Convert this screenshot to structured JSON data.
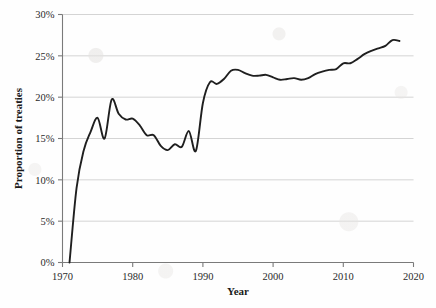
{
  "chart_data": {
    "type": "line",
    "title": "",
    "xlabel": "Year",
    "ylabel": "Proportion of treaties",
    "xlim": [
      1970,
      2020
    ],
    "ylim": [
      0,
      30
    ],
    "grid": true,
    "legend": false,
    "legend_position": "none",
    "x_ticks": [
      "1970",
      "1980",
      "1990",
      "2000",
      "2010",
      "2020"
    ],
    "x_tick_values": [
      1970,
      1980,
      1990,
      2000,
      2010,
      2020
    ],
    "y_ticks": [
      "0%",
      "5%",
      "10%",
      "15%",
      "20%",
      "25%",
      "30%"
    ],
    "y_tick_values": [
      0,
      5,
      10,
      15,
      20,
      25,
      30
    ],
    "y_unit": "%",
    "line_color": "#1f1f1f",
    "grid_color": "#c9c9c9",
    "axis_color": "#7a7a7a",
    "series": [
      {
        "name": "Proportion of treaties",
        "x": [
          1971,
          1972,
          1973,
          1974,
          1975,
          1976,
          1977,
          1978,
          1979,
          1980,
          1981,
          1982,
          1983,
          1984,
          1985,
          1986,
          1987,
          1988,
          1989,
          1990,
          1991,
          1992,
          1993,
          1994,
          1995,
          1996,
          1997,
          1998,
          1999,
          2000,
          2001,
          2002,
          2003,
          2004,
          2005,
          2006,
          2007,
          2008,
          2009,
          2010,
          2011,
          2012,
          2013,
          2014,
          2015,
          2016,
          2017,
          2018
        ],
        "values": [
          0.0,
          9.0,
          13.5,
          15.8,
          17.5,
          15.0,
          19.7,
          18.0,
          17.3,
          17.4,
          16.6,
          15.4,
          15.4,
          14.1,
          13.6,
          14.3,
          14.0,
          15.9,
          13.5,
          19.3,
          21.8,
          21.6,
          22.2,
          23.2,
          23.3,
          22.9,
          22.6,
          22.6,
          22.7,
          22.4,
          22.1,
          22.2,
          22.3,
          22.1,
          22.3,
          22.8,
          23.1,
          23.3,
          23.4,
          24.1,
          24.1,
          24.6,
          25.2,
          25.6,
          25.9,
          26.2,
          26.9,
          26.8
        ]
      }
    ]
  },
  "axes": {
    "y_title": "Proportion of treaties",
    "x_title": "Year"
  }
}
